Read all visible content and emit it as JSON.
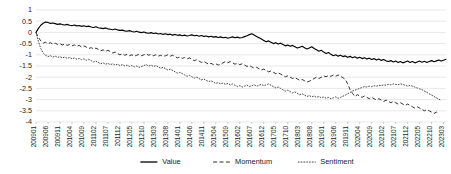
{
  "chart_data": {
    "type": "line",
    "title": "",
    "xlabel": "",
    "ylabel": "",
    "ylim": [
      -4,
      1
    ],
    "ytick_labels": [
      "1",
      "0.5",
      "0",
      "-0.5",
      "-1",
      "-1.5",
      "-2",
      "-2.5",
      "-3",
      "-3.5",
      "-4"
    ],
    "ytick_values": [
      1,
      0.5,
      0,
      -0.5,
      -1,
      -1.5,
      -2,
      -2.5,
      -3,
      -3.5,
      -4
    ],
    "grid": true,
    "legend_position": "bottom",
    "x_tick_labels": [
      "200901",
      "200906",
      "200911",
      "201004",
      "201009",
      "201102",
      "201107",
      "201112",
      "201205",
      "201210",
      "201303",
      "201308",
      "201401",
      "201406",
      "201411",
      "201504",
      "201509",
      "201602",
      "201607",
      "201612",
      "201705",
      "201710",
      "201803",
      "201808",
      "201901",
      "201906",
      "201911",
      "202004",
      "202009",
      "202102",
      "202107",
      "202112",
      "202205",
      "202210",
      "202303"
    ],
    "x_tick_index": [
      0,
      5,
      10,
      15,
      20,
      25,
      30,
      35,
      40,
      45,
      50,
      55,
      60,
      65,
      70,
      75,
      80,
      85,
      90,
      95,
      100,
      105,
      110,
      115,
      120,
      125,
      130,
      135,
      140,
      145,
      150,
      155,
      160,
      165,
      170
    ],
    "n_points": 172,
    "series": [
      {
        "name": "Value",
        "style": "solid",
        "color": "#000000",
        "values": [
          0.0,
          0.18,
          0.32,
          0.41,
          0.46,
          0.44,
          0.4,
          0.42,
          0.39,
          0.36,
          0.38,
          0.35,
          0.33,
          0.36,
          0.32,
          0.3,
          0.33,
          0.29,
          0.31,
          0.27,
          0.3,
          0.26,
          0.28,
          0.24,
          0.22,
          0.25,
          0.21,
          0.19,
          0.17,
          0.2,
          0.16,
          0.14,
          0.12,
          0.15,
          0.11,
          0.09,
          0.1,
          0.07,
          0.05,
          0.08,
          0.04,
          0.02,
          0.05,
          0.01,
          -0.01,
          0.02,
          -0.02,
          -0.04,
          -0.01,
          -0.05,
          -0.03,
          -0.07,
          -0.05,
          -0.09,
          -0.06,
          -0.1,
          -0.08,
          -0.12,
          -0.09,
          -0.13,
          -0.11,
          -0.15,
          -0.12,
          -0.16,
          -0.14,
          -0.11,
          -0.15,
          -0.13,
          -0.17,
          -0.14,
          -0.18,
          -0.16,
          -0.2,
          -0.17,
          -0.21,
          -0.19,
          -0.23,
          -0.2,
          -0.24,
          -0.22,
          -0.26,
          -0.23,
          -0.2,
          -0.24,
          -0.21,
          -0.25,
          -0.23,
          -0.19,
          -0.15,
          -0.1,
          -0.06,
          -0.12,
          -0.18,
          -0.24,
          -0.3,
          -0.36,
          -0.42,
          -0.38,
          -0.44,
          -0.5,
          -0.46,
          -0.52,
          -0.48,
          -0.54,
          -0.6,
          -0.56,
          -0.62,
          -0.58,
          -0.64,
          -0.7,
          -0.66,
          -0.62,
          -0.68,
          -0.74,
          -0.7,
          -0.64,
          -0.72,
          -0.78,
          -0.84,
          -0.8,
          -0.88,
          -0.94,
          -0.9,
          -0.98,
          -1.04,
          -1.0,
          -1.06,
          -1.02,
          -1.08,
          -1.05,
          -1.11,
          -1.07,
          -1.13,
          -1.09,
          -1.15,
          -1.11,
          -1.17,
          -1.13,
          -1.19,
          -1.15,
          -1.21,
          -1.17,
          -1.23,
          -1.19,
          -1.25,
          -1.21,
          -1.27,
          -1.3,
          -1.26,
          -1.32,
          -1.28,
          -1.34,
          -1.3,
          -1.36,
          -1.32,
          -1.28,
          -1.34,
          -1.3,
          -1.36,
          -1.32,
          -1.28,
          -1.33,
          -1.29,
          -1.34,
          -1.3,
          -1.26,
          -1.31,
          -1.27,
          -1.23,
          -1.28,
          -1.24,
          -1.2
        ]
      },
      {
        "name": "Momentum",
        "style": "dashed",
        "color": "#303030",
        "values": [
          0.0,
          -0.22,
          -0.38,
          -0.48,
          -0.44,
          -0.5,
          -0.46,
          -0.52,
          -0.48,
          -0.54,
          -0.5,
          -0.56,
          -0.52,
          -0.58,
          -0.54,
          -0.6,
          -0.56,
          -0.62,
          -0.58,
          -0.64,
          -0.6,
          -0.66,
          -0.72,
          -0.68,
          -0.74,
          -0.7,
          -0.76,
          -0.82,
          -0.78,
          -0.84,
          -0.8,
          -0.86,
          -0.92,
          -0.88,
          -0.94,
          -1.0,
          -0.96,
          -1.02,
          -0.98,
          -1.04,
          -1.0,
          -1.06,
          -1.02,
          -0.98,
          -1.04,
          -1.0,
          -0.96,
          -1.02,
          -0.98,
          -1.04,
          -1.0,
          -1.06,
          -1.02,
          -1.08,
          -1.04,
          -1.0,
          -1.06,
          -1.02,
          -1.08,
          -1.14,
          -1.1,
          -1.16,
          -1.12,
          -1.18,
          -1.14,
          -1.2,
          -1.26,
          -1.22,
          -1.28,
          -1.34,
          -1.3,
          -1.36,
          -1.42,
          -1.38,
          -1.44,
          -1.4,
          -1.46,
          -1.42,
          -1.36,
          -1.3,
          -1.36,
          -1.3,
          -1.36,
          -1.42,
          -1.38,
          -1.44,
          -1.4,
          -1.46,
          -1.52,
          -1.48,
          -1.54,
          -1.6,
          -1.56,
          -1.62,
          -1.68,
          -1.64,
          -1.7,
          -1.76,
          -1.72,
          -1.78,
          -1.84,
          -1.8,
          -1.86,
          -1.92,
          -1.98,
          -1.94,
          -2.0,
          -2.06,
          -2.02,
          -2.08,
          -2.14,
          -2.1,
          -2.16,
          -2.22,
          -2.18,
          -2.12,
          -2.06,
          -2.0,
          -2.06,
          -2.0,
          -1.94,
          -1.98,
          -1.92,
          -1.96,
          -1.9,
          -1.96,
          -1.9,
          -1.96,
          -2.02,
          -2.1,
          -2.3,
          -2.55,
          -2.72,
          -2.86,
          -2.78,
          -2.84,
          -2.9,
          -2.84,
          -2.9,
          -2.96,
          -2.9,
          -2.96,
          -3.02,
          -2.96,
          -3.02,
          -3.08,
          -3.02,
          -3.08,
          -3.14,
          -3.08,
          -3.14,
          -3.2,
          -3.14,
          -3.2,
          -3.26,
          -3.2,
          -3.26,
          -3.32,
          -3.38,
          -3.32,
          -3.38,
          -3.44,
          -3.5,
          -3.44,
          -3.5,
          -3.56,
          -3.62,
          -3.56,
          -3.62
        ]
      },
      {
        "name": "Sentiment",
        "style": "dotted",
        "color": "#4a4a4a",
        "values": [
          0.0,
          -0.4,
          -0.72,
          -0.92,
          -1.02,
          -1.08,
          -1.04,
          -1.1,
          -1.06,
          -1.12,
          -1.08,
          -1.14,
          -1.1,
          -1.16,
          -1.12,
          -1.18,
          -1.14,
          -1.2,
          -1.16,
          -1.22,
          -1.18,
          -1.24,
          -1.2,
          -1.26,
          -1.32,
          -1.28,
          -1.34,
          -1.4,
          -1.36,
          -1.42,
          -1.38,
          -1.44,
          -1.4,
          -1.46,
          -1.42,
          -1.48,
          -1.44,
          -1.5,
          -1.46,
          -1.52,
          -1.48,
          -1.54,
          -1.5,
          -1.56,
          -1.52,
          -1.48,
          -1.44,
          -1.5,
          -1.46,
          -1.52,
          -1.48,
          -1.54,
          -1.6,
          -1.56,
          -1.62,
          -1.68,
          -1.64,
          -1.7,
          -1.76,
          -1.82,
          -1.78,
          -1.84,
          -1.9,
          -1.96,
          -1.92,
          -1.98,
          -2.04,
          -2.0,
          -2.06,
          -2.12,
          -2.08,
          -2.14,
          -2.2,
          -2.16,
          -2.22,
          -2.28,
          -2.24,
          -2.3,
          -2.26,
          -2.32,
          -2.28,
          -2.34,
          -2.3,
          -2.36,
          -2.42,
          -2.38,
          -2.44,
          -2.4,
          -2.36,
          -2.42,
          -2.38,
          -2.34,
          -2.4,
          -2.36,
          -2.32,
          -2.38,
          -2.34,
          -2.3,
          -2.36,
          -2.42,
          -2.48,
          -2.44,
          -2.5,
          -2.56,
          -2.62,
          -2.58,
          -2.64,
          -2.7,
          -2.66,
          -2.72,
          -2.78,
          -2.74,
          -2.8,
          -2.86,
          -2.82,
          -2.88,
          -2.84,
          -2.9,
          -2.86,
          -2.92,
          -2.88,
          -2.94,
          -2.9,
          -2.96,
          -2.92,
          -2.88,
          -2.94,
          -2.9,
          -2.85,
          -2.8,
          -2.74,
          -2.68,
          -2.62,
          -2.58,
          -2.54,
          -2.5,
          -2.46,
          -2.42,
          -2.44,
          -2.4,
          -2.42,
          -2.38,
          -2.4,
          -2.36,
          -2.38,
          -2.34,
          -2.36,
          -2.32,
          -2.34,
          -2.3,
          -2.32,
          -2.34,
          -2.3,
          -2.32,
          -2.36,
          -2.4,
          -2.36,
          -2.4,
          -2.44,
          -2.48,
          -2.52,
          -2.56,
          -2.62,
          -2.68,
          -2.74,
          -2.8,
          -2.86,
          -2.92,
          -2.98,
          -3.04
        ]
      }
    ]
  },
  "legend": {
    "items": [
      {
        "label": "Value",
        "style": "solid"
      },
      {
        "label": "Momentum",
        "style": "dashed"
      },
      {
        "label": "Sentiment",
        "style": "dotted"
      }
    ]
  }
}
